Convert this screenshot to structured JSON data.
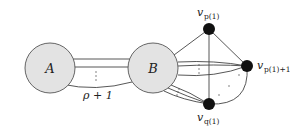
{
  "diagram": {
    "type": "graph",
    "colors": {
      "big_node_fill": "#e3e3e3",
      "big_node_stroke": "#555555",
      "small_node_fill": "#111111",
      "edge": "#444444"
    },
    "nodes": [
      {
        "id": "A",
        "label": "A",
        "kind": "cluster"
      },
      {
        "id": "B",
        "label": "B",
        "kind": "cluster"
      },
      {
        "id": "vp1",
        "label_main": "v",
        "label_sub": "p(1)",
        "kind": "vertex"
      },
      {
        "id": "vp1p1",
        "label_main": "v",
        "label_sub": "p(1)+1",
        "kind": "vertex"
      },
      {
        "id": "vq1",
        "label_main": "v",
        "label_sub": "q(1)",
        "kind": "vertex"
      }
    ],
    "edges": [
      {
        "from": "A",
        "to": "B",
        "multiplicity_label": "ρ + 1"
      },
      {
        "from": "B",
        "to": "vp1"
      },
      {
        "from": "B",
        "to": "vp1p1",
        "multiple": true
      },
      {
        "from": "B",
        "to": "vq1",
        "multiple": true
      },
      {
        "from": "vp1",
        "to": "vp1p1"
      },
      {
        "from": "vp1",
        "to": "vq1"
      },
      {
        "from": "vq1",
        "to": "vp1p1",
        "curved": true
      }
    ],
    "labels": {
      "A": "A",
      "B": "B",
      "rho": "ρ + 1",
      "v": "v",
      "sub_p1": "p(1)",
      "sub_p1p1": "p(1)+1",
      "sub_q1": "q(1)"
    }
  }
}
